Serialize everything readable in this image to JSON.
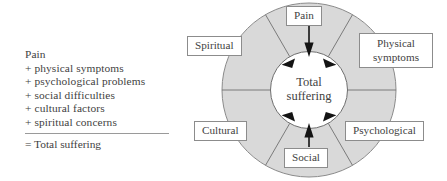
{
  "equation": {
    "lines": [
      "Pain",
      "+ physical symptoms",
      "+ psychological problems",
      "+ social difficulties",
      "+ cultural factors",
      "+ spiritual concerns"
    ],
    "total": "= Total suffering"
  },
  "wheel": {
    "center_label_line1": "Total",
    "center_label_line2": "suffering",
    "segments": [
      {
        "label": "Pain",
        "angle_deg": 90
      },
      {
        "label": "Physical symptoms",
        "angle_deg": 30
      },
      {
        "label": "Psychological",
        "angle_deg": 330
      },
      {
        "label": "Social",
        "angle_deg": 270
      },
      {
        "label": "Cultural",
        "angle_deg": 210
      },
      {
        "label": "Spiritual",
        "angle_deg": 150
      }
    ],
    "arrow_count": 6
  },
  "colors": {
    "ring_fill": "#d9d9d9",
    "ring_stroke": "#8a8a8a",
    "divider": "#6f6f6f",
    "arrow": "#1a1a1a",
    "text": "#3f3f3f",
    "box_border": "#8c8c8c",
    "box_fill": "#ffffff",
    "background": "#ffffff"
  }
}
